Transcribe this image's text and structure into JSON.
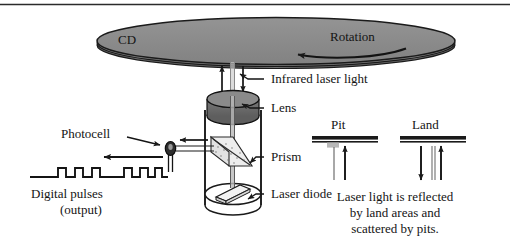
{
  "figure": {
    "title_rule": "horizontal-rule"
  },
  "disc": {
    "label": "CD",
    "rotation_label": "Rotation",
    "fill_color": "#8c8c8c",
    "edge_color": "#1a1a1a"
  },
  "callouts": {
    "infrared": "Infrared laser light",
    "lens": "Lens",
    "prism": "Prism",
    "laser_diode": "Laser diode",
    "photocell": "Photocell"
  },
  "output": {
    "line1": "Digital pulses",
    "line2": "(output)"
  },
  "pit_land": {
    "pit_label": "Pit",
    "land_label": "Land",
    "caption_line1": "Laser light is reflected",
    "caption_line2": "by land areas and",
    "caption_line3": "scattered by pits."
  },
  "icons": {
    "up_arrow": "arrow-up-icon",
    "down_arrow": "arrow-down-icon",
    "left_arrow": "arrow-left-icon",
    "rotation_arrow": "rotation-arrow-icon",
    "leader_line": "leader-line-icon"
  },
  "colors": {
    "disc_gray": "#8c8c8c",
    "lens_gray": "#707070",
    "prism_light": "#e8e8e8",
    "stroke": "#1a1a1a",
    "background": "#ffffff"
  }
}
